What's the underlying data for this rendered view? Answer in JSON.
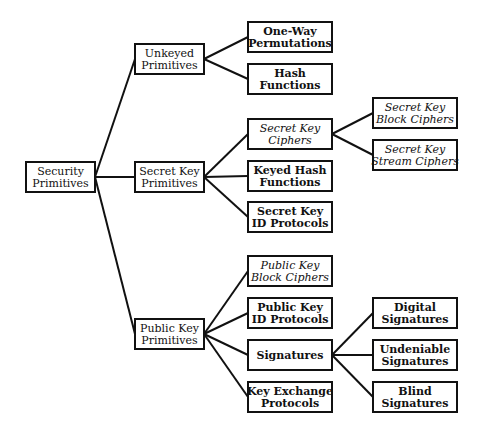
{
  "diagram": {
    "type": "hierarchy-tree",
    "colors": {
      "line": "#111111",
      "box_fill": "#ffffff",
      "text": "#111111"
    },
    "nodes": [
      {
        "id": "security-primitives",
        "lines": [
          "Security",
          "Primitives"
        ],
        "style": "plain",
        "x": 26,
        "y": 162,
        "w": 69,
        "h": 30
      },
      {
        "id": "unkeyed-primitives",
        "lines": [
          "Unkeyed",
          "Primitives"
        ],
        "style": "plain",
        "x": 135,
        "y": 44,
        "w": 69,
        "h": 30
      },
      {
        "id": "secret-key-primitives",
        "lines": [
          "Secret Key",
          "Primitives"
        ],
        "style": "plain",
        "x": 135,
        "y": 162,
        "w": 69,
        "h": 30
      },
      {
        "id": "public-key-primitives",
        "lines": [
          "Public Key",
          "Primitives"
        ],
        "style": "plain",
        "x": 135,
        "y": 319,
        "w": 69,
        "h": 30
      },
      {
        "id": "one-way-permutations",
        "lines": [
          "One-Way",
          "Permutations"
        ],
        "style": "bold",
        "x": 248,
        "y": 22,
        "w": 84,
        "h": 30
      },
      {
        "id": "hash-functions",
        "lines": [
          "Hash",
          "Functions"
        ],
        "style": "bold",
        "x": 248,
        "y": 64,
        "w": 84,
        "h": 30
      },
      {
        "id": "secret-key-ciphers",
        "lines": [
          "Secret Key",
          "Ciphers"
        ],
        "style": "italic",
        "x": 248,
        "y": 119,
        "w": 84,
        "h": 30
      },
      {
        "id": "keyed-hash-functions",
        "lines": [
          "Keyed Hash",
          "Functions"
        ],
        "style": "bold",
        "x": 248,
        "y": 161,
        "w": 84,
        "h": 30
      },
      {
        "id": "secret-key-id-protocols",
        "lines": [
          "Secret Key",
          "ID Protocols"
        ],
        "style": "bold",
        "x": 248,
        "y": 202,
        "w": 84,
        "h": 30
      },
      {
        "id": "public-key-block-ciphers",
        "lines": [
          "Public Key",
          "Block Ciphers"
        ],
        "style": "italic",
        "x": 248,
        "y": 256,
        "w": 84,
        "h": 30
      },
      {
        "id": "public-key-id-protocols",
        "lines": [
          "Public Key",
          "ID Protocols"
        ],
        "style": "bold",
        "x": 248,
        "y": 298,
        "w": 84,
        "h": 30
      },
      {
        "id": "signatures",
        "lines": [
          "Signatures"
        ],
        "style": "bold",
        "x": 248,
        "y": 340,
        "w": 84,
        "h": 30
      },
      {
        "id": "key-exchange-protocols",
        "lines": [
          "Key Exchange",
          "Protocols"
        ],
        "style": "bold",
        "x": 248,
        "y": 382,
        "w": 84,
        "h": 30
      },
      {
        "id": "secret-key-block-ciphers",
        "lines": [
          "Secret Key",
          "Block Ciphers"
        ],
        "style": "italic",
        "x": 373,
        "y": 98,
        "w": 84,
        "h": 30
      },
      {
        "id": "secret-key-stream-ciphers",
        "lines": [
          "Secret Key",
          "Stream Ciphers"
        ],
        "style": "italic",
        "x": 373,
        "y": 140,
        "w": 84,
        "h": 30
      },
      {
        "id": "digital-signatures",
        "lines": [
          "Digital",
          "Signatures"
        ],
        "style": "bold",
        "x": 373,
        "y": 298,
        "w": 84,
        "h": 30
      },
      {
        "id": "undeniable-signatures",
        "lines": [
          "Undeniable",
          "Signatures"
        ],
        "style": "bold",
        "x": 373,
        "y": 340,
        "w": 84,
        "h": 30
      },
      {
        "id": "blind-signatures",
        "lines": [
          "Blind",
          "Signatures"
        ],
        "style": "bold",
        "x": 373,
        "y": 382,
        "w": 84,
        "h": 30
      }
    ],
    "edges": [
      {
        "from": "security-primitives",
        "to": "unkeyed-primitives"
      },
      {
        "from": "security-primitives",
        "to": "secret-key-primitives"
      },
      {
        "from": "security-primitives",
        "to": "public-key-primitives"
      },
      {
        "from": "unkeyed-primitives",
        "to": "one-way-permutations"
      },
      {
        "from": "unkeyed-primitives",
        "to": "hash-functions"
      },
      {
        "from": "secret-key-primitives",
        "to": "secret-key-ciphers"
      },
      {
        "from": "secret-key-primitives",
        "to": "keyed-hash-functions"
      },
      {
        "from": "secret-key-primitives",
        "to": "secret-key-id-protocols"
      },
      {
        "from": "secret-key-ciphers",
        "to": "secret-key-block-ciphers"
      },
      {
        "from": "secret-key-ciphers",
        "to": "secret-key-stream-ciphers"
      },
      {
        "from": "public-key-primitives",
        "to": "public-key-block-ciphers"
      },
      {
        "from": "public-key-primitives",
        "to": "public-key-id-protocols"
      },
      {
        "from": "public-key-primitives",
        "to": "signatures"
      },
      {
        "from": "public-key-primitives",
        "to": "key-exchange-protocols"
      },
      {
        "from": "signatures",
        "to": "digital-signatures"
      },
      {
        "from": "signatures",
        "to": "undeniable-signatures"
      },
      {
        "from": "signatures",
        "to": "blind-signatures"
      }
    ]
  }
}
